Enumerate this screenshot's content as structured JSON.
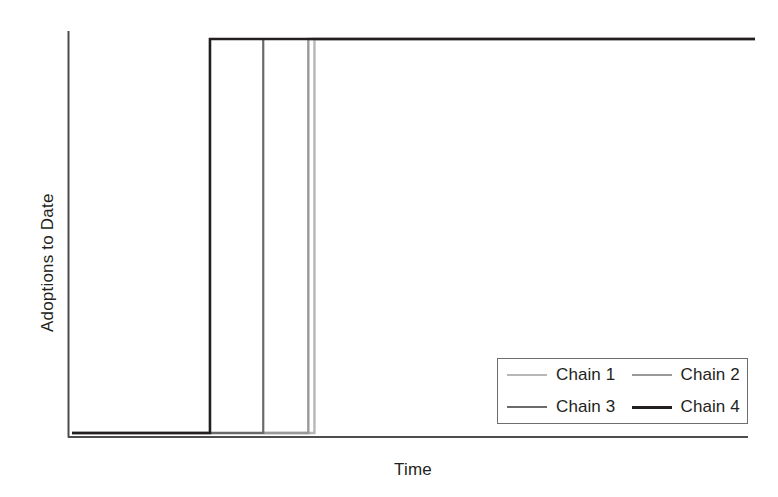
{
  "chart_data": {
    "type": "line",
    "title": "",
    "subtitle": "",
    "xlabel": "Time",
    "ylabel": "Adoptions to Date",
    "grid": false,
    "legend_position": "bottom-right",
    "x": [
      0,
      1
    ],
    "xlim": [
      0,
      100
    ],
    "ylim": [
      0,
      100
    ],
    "axis_ticks_shown": false,
    "series": [
      {
        "name": "Chain 1",
        "color": "#b7b7b7",
        "step_time": 35.5,
        "baseline_value": 0,
        "plateau_value": 100,
        "points": [
          [
            0,
            0
          ],
          [
            35.5,
            0
          ],
          [
            35.5,
            100
          ],
          [
            100,
            100
          ]
        ]
      },
      {
        "name": "Chain 2",
        "color": "#9a9a9a",
        "step_time": 34.6,
        "baseline_value": 0,
        "plateau_value": 100,
        "points": [
          [
            0,
            0
          ],
          [
            34.6,
            0
          ],
          [
            34.6,
            100
          ],
          [
            100,
            100
          ]
        ]
      },
      {
        "name": "Chain 3",
        "color": "#6a6a6a",
        "step_time": 28.0,
        "baseline_value": 0,
        "plateau_value": 100,
        "points": [
          [
            0,
            0
          ],
          [
            28.0,
            0
          ],
          [
            28.0,
            100
          ],
          [
            100,
            100
          ]
        ]
      },
      {
        "name": "Chain 4",
        "color": "#231f20",
        "step_time": 20.2,
        "baseline_value": 0,
        "plateau_value": 100,
        "points": [
          [
            0,
            0
          ],
          [
            20.2,
            0
          ],
          [
            20.2,
            100
          ],
          [
            100,
            100
          ]
        ]
      }
    ]
  },
  "axes": {
    "y_label": "Adoptions to Date",
    "x_label": "Time",
    "axis_color": "#4d4d4d"
  },
  "legend": {
    "items": [
      {
        "label": "Chain 1",
        "color": "#b7b7b7",
        "width": 2
      },
      {
        "label": "Chain 2",
        "color": "#9a9a9a",
        "width": 2
      },
      {
        "label": "Chain 3",
        "color": "#6a6a6a",
        "width": 2
      },
      {
        "label": "Chain 4",
        "color": "#231f20",
        "width": 3
      }
    ],
    "border_color": "#6e6e6e"
  }
}
